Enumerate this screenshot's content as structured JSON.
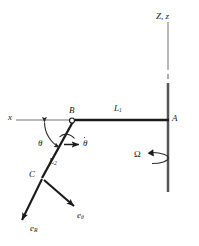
{
  "figure": {
    "background": "#ffffff",
    "ink": "#1a1a1a",
    "light_ink": "#9a9a9a",
    "width": 199,
    "height": 246
  },
  "labels": {
    "vertical_axis": "Z, z",
    "horizontal_axis": "x",
    "point_a": "A",
    "point_b": "B",
    "point_c": "C",
    "link_1": "L",
    "link_1_sub": "1",
    "link_2": "L",
    "link_2_sub": "2",
    "theta": "θ",
    "theta_dot": "θ",
    "omega": "Ω",
    "unit_vector_r": "e",
    "unit_vector_r_sub": "R",
    "unit_vector_theta": "e",
    "unit_vector_theta_sub": "θ"
  },
  "geometry": {
    "point_a": [
      168,
      120
    ],
    "point_b": [
      72,
      120
    ],
    "point_c": [
      42,
      178
    ],
    "x_axis_left_end": [
      16,
      120
    ],
    "vertical_axis_top": [
      168,
      22
    ],
    "vertical_axis_bottom": [
      168,
      192
    ],
    "vertical_axis_break": [
      168,
      74
    ],
    "e_r_tip": [
      22,
      221
    ],
    "e_theta_tip": [
      75,
      209
    ],
    "theta_arc_radius": 30,
    "spin_ellipse_center": [
      168,
      158
    ],
    "spin_ellipse_rx": 16,
    "spin_ellipse_ry": 5
  },
  "elements": {
    "pin_joint_b": "open-circle-pin-joint",
    "rotation_arrow": "omega-spin-arrow",
    "theta_arc_arrow": "theta-angle-arc",
    "theta_dot_arrow": "theta-rate-arrow"
  }
}
